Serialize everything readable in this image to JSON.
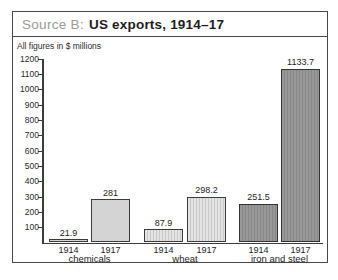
{
  "frame": {
    "title_prefix": "Source B:",
    "title": "US exports, 1914–17"
  },
  "chart_data": {
    "type": "bar",
    "title": "Source B: US exports, 1914–17",
    "subtitle": "All figures in $ millions",
    "ylabel": "",
    "xlabel": "",
    "ylim": [
      0,
      1200
    ],
    "ytick_step": 100,
    "grid": false,
    "legend": false,
    "value_labels_shown": true,
    "categories": [
      "chemicals",
      "wheat",
      "iron and steel"
    ],
    "series": [
      {
        "name": "1914",
        "values": [
          21.9,
          87.9,
          251.5
        ]
      },
      {
        "name": "1917",
        "values": [
          281,
          298.2,
          1133.7
        ]
      }
    ],
    "groups": [
      {
        "label": "chemicals",
        "bars": [
          {
            "year": "1914",
            "value": 21.9,
            "value_label": "21.9"
          },
          {
            "year": "1917",
            "value": 281,
            "value_label": "281"
          }
        ]
      },
      {
        "label": "wheat",
        "bars": [
          {
            "year": "1914",
            "value": 87.9,
            "value_label": "87.9"
          },
          {
            "year": "1917",
            "value": 298.2,
            "value_label": "298.2"
          }
        ]
      },
      {
        "label": "iron and steel",
        "bars": [
          {
            "year": "1914",
            "value": 251.5,
            "value_label": "251.5"
          },
          {
            "year": "1917",
            "value": 1133.7,
            "value_label": "1133.7"
          }
        ]
      }
    ],
    "bar_colors": {
      "chemicals": "#d4d4d4",
      "wheat": "#dedede",
      "iron and steel": "#8e8e8e"
    },
    "axis_color": "#3c3c3c"
  }
}
